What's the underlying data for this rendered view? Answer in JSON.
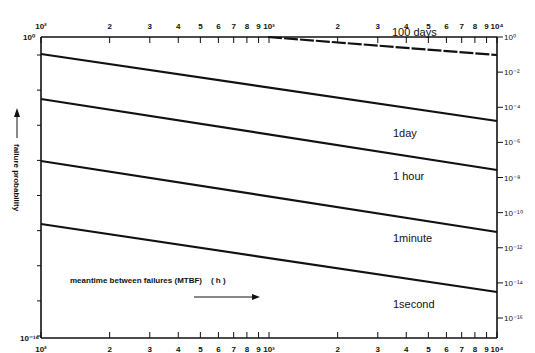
{
  "chart_data": {
    "type": "line",
    "title": "",
    "xlabel": "meantime between failures (MTBF)  (h)",
    "ylabel": "failure probability",
    "x_scale": "log",
    "y_scale": "log",
    "xlim": [
      100,
      10000
    ],
    "ylim": [
      1e-16,
      1
    ],
    "x_ticks_major": [
      "10^2",
      "10^3",
      "10^4"
    ],
    "x_tick_labels": [
      "10²",
      "2",
      "3",
      "4",
      "5",
      "6",
      "7",
      "8",
      "9",
      "10³",
      "2",
      "3",
      "4",
      "5",
      "6",
      "7",
      "8",
      "9",
      "10⁴"
    ],
    "y_tick_labels_right": [
      "10⁰",
      "10⁻²",
      "10⁻⁴",
      "10⁻⁶",
      "10⁻⁸",
      "10⁻¹⁰",
      "10⁻¹²",
      "10⁻¹⁴",
      "10⁻¹⁶"
    ],
    "y_tick_labels_left": [
      "10⁰",
      "10⁻¹⁶"
    ],
    "grid": false,
    "legend": "inline labels near right end of each line",
    "series": [
      {
        "name": "100 days",
        "x": [
          530,
          10000
        ],
        "y": [
          1.0,
          0.1
        ]
      },
      {
        "name": "1day",
        "x": [
          100,
          10000
        ],
        "y": [
          0.12,
          3e-05
        ]
      },
      {
        "name": "1hour",
        "x": [
          100,
          10000
        ],
        "y": [
          0.0003,
          1e-07
        ]
      },
      {
        "name": "1minute",
        "x": [
          100,
          10000
        ],
        "y": [
          2e-07,
          6e-11
        ]
      },
      {
        "name": "1second",
        "x": [
          100,
          10000
        ],
        "y": [
          3e-10,
          8e-14
        ]
      }
    ]
  },
  "labels": {
    "top_x": [
      "10²",
      "2",
      "3",
      "4",
      "5",
      "6",
      "7",
      "8",
      "9",
      "10³",
      "2",
      "3",
      "4",
      "5",
      "6",
      "7",
      "8",
      "9",
      "10⁴"
    ],
    "bottom_x": [
      "10²",
      "2",
      "3",
      "4",
      "5",
      "6",
      "7",
      "8",
      "9",
      "10³",
      "2",
      "3",
      "4",
      "5",
      "6",
      "7",
      "8",
      "9",
      "10⁴"
    ],
    "right_y": [
      "10⁰",
      "10⁻²",
      "10⁻⁴",
      "10⁻⁶",
      "10⁻⁸",
      "10⁻¹⁰",
      "10⁻¹²",
      "10⁻¹⁴",
      "10⁻¹⁶"
    ],
    "left_top": "10⁰",
    "left_bottom": "10⁻¹⁶",
    "ylabel": "failure probability",
    "xlabel": "meantime between failures (MTBF)    ( h )",
    "series_labels": [
      "100 days",
      "1day",
      "1 hour",
      "1minute",
      "1second"
    ]
  }
}
